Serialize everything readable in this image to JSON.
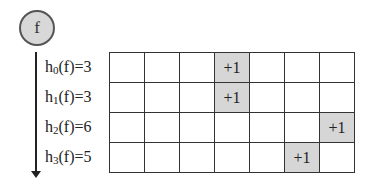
{
  "node": {
    "label": "f"
  },
  "rows": [
    {
      "func": "h",
      "sub": "0",
      "arg": "(f)",
      "value": "=3",
      "hit_col": 3
    },
    {
      "func": "h",
      "sub": "1",
      "arg": "(f)",
      "value": "=3",
      "hit_col": 3
    },
    {
      "func": "h",
      "sub": "2",
      "arg": "(f)",
      "value": "=6",
      "hit_col": 6
    },
    {
      "func": "h",
      "sub": "3",
      "arg": "(f)",
      "value": "=5",
      "hit_col": 5
    }
  ],
  "grid": {
    "columns": 7,
    "rows": 4,
    "increment_label": "+1",
    "cells": [
      [
        "",
        "",
        "",
        "+1",
        "",
        "",
        ""
      ],
      [
        "",
        "",
        "",
        "+1",
        "",
        "",
        ""
      ],
      [
        "",
        "",
        "",
        "",
        "",
        "",
        "+1"
      ],
      [
        "",
        "",
        "",
        "",
        "",
        "+1",
        ""
      ]
    ]
  },
  "colors": {
    "highlight": "#d6d6d6",
    "node_fill": "#d8d8d8",
    "line": "#333333"
  }
}
